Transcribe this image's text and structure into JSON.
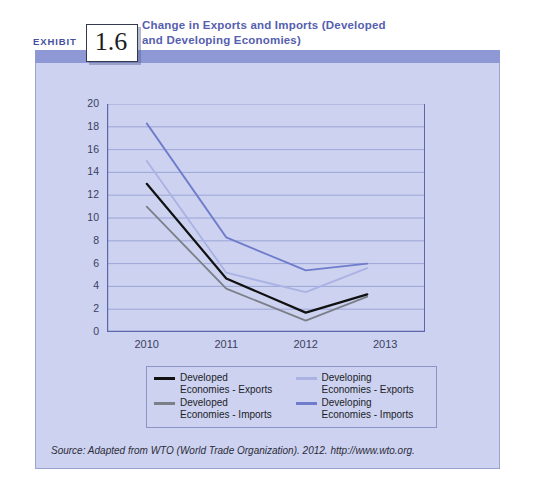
{
  "exhibit": {
    "label": "EXHIBIT",
    "number": "1.6"
  },
  "figure": {
    "title": "Change in Exports and Imports (Developed and Developing Economies)",
    "source": "Source: Adapted from WTO (World Trade Organization). 2012. http://www.wto.org."
  },
  "colors": {
    "panel_background": "#ccd2ef",
    "panel_topbar": "#8d98d4",
    "panel_border": "#9aa3cf",
    "title_text": "#5560b0",
    "grid_line": "#8f9ad1",
    "axis_line": "#5b66ab",
    "developed_exports": "#111111",
    "developed_imports": "#7b7f88",
    "developing_exports": "#aab2e4",
    "developing_imports": "#6f7ccb"
  },
  "legend": {
    "entries": [
      {
        "label": "Developed\nEconomies - Exports",
        "color": "#111111"
      },
      {
        "label": "Developing\nEconomies - Exports",
        "color": "#aab2e4"
      },
      {
        "label": "Developed\nEconomies - Imports",
        "color": "#7b7f88"
      },
      {
        "label": "Developing\nEconomies - Imports",
        "color": "#6f7ccb"
      }
    ]
  },
  "chart_data": {
    "type": "line",
    "title": "Change in Exports and Imports (Developed and Developing Economies)",
    "xlabel": "",
    "ylabel": "",
    "categories": [
      "2010",
      "2011",
      "2012",
      "2013"
    ],
    "x_tick_labels": [
      "2010",
      "2011",
      "2012",
      "2013"
    ],
    "y_tick_labels": [
      "0",
      "2",
      "4",
      "6",
      "8",
      "10",
      "12",
      "14",
      "16",
      "18",
      "20"
    ],
    "ylim": [
      0,
      20
    ],
    "ytick_step": 2,
    "grid": true,
    "legend_position": "bottom",
    "note": "Final data points are plotted slightly before the 2013 tick.",
    "series": [
      {
        "name": "Developed Economies - Exports",
        "color": "#111111",
        "values": [
          13.0,
          4.7,
          1.7,
          3.3
        ]
      },
      {
        "name": "Developed Economies - Imports",
        "color": "#7b7f88",
        "values": [
          11.0,
          3.8,
          1.0,
          3.1
        ]
      },
      {
        "name": "Developing Economies - Exports",
        "color": "#aab2e4",
        "values": [
          15.0,
          5.2,
          3.5,
          5.6
        ]
      },
      {
        "name": "Developing Economies - Imports",
        "color": "#6f7ccb",
        "values": [
          18.3,
          8.3,
          5.4,
          6.0
        ]
      }
    ]
  }
}
